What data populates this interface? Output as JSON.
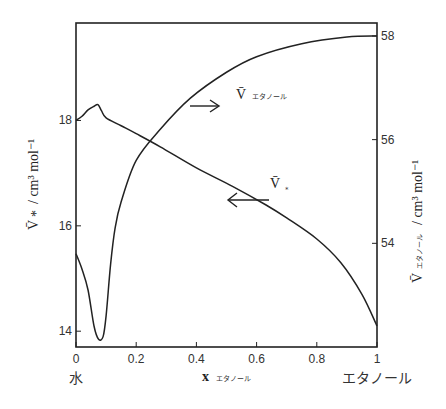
{
  "chart_data": {
    "type": "line",
    "title": "",
    "xlabel": "x エタノール",
    "x_axis": {
      "range": [
        0,
        1
      ],
      "ticks": [
        0,
        0.2,
        0.4,
        0.6,
        0.8,
        1
      ],
      "tick_labels": [
        "0",
        "0.2",
        "0.4",
        "0.6",
        "0.8",
        "1"
      ],
      "end_labels": {
        "left": "水",
        "right": "エタノール"
      },
      "label_main": "x",
      "label_sub": "エタノール"
    },
    "y_left": {
      "label_main": "V̄",
      "label_sub": "水",
      "label_unit": "/ cm³ mol⁻¹",
      "ylim": [
        13.7,
        19.85
      ],
      "ticks": [
        14,
        16,
        18
      ],
      "tick_labels": [
        "14",
        "16",
        "18"
      ]
    },
    "y_right": {
      "label_main": "V̄",
      "label_sub": "エタノール",
      "label_unit": "/ cm³ mol⁻¹",
      "ylim": [
        52.0,
        58.25
      ],
      "ticks": [
        54,
        56,
        58
      ],
      "tick_labels": [
        "54",
        "56",
        "58"
      ]
    },
    "grid": false,
    "legend": "inline annotations with arrows",
    "series": [
      {
        "name": "V̄ 水",
        "axis": "left",
        "annotation": {
          "main": "V̄",
          "sub": "水",
          "arrow": "left"
        },
        "x": [
          0,
          0.02,
          0.04,
          0.06,
          0.073,
          0.085,
          0.1,
          0.15,
          0.2,
          0.28,
          0.4,
          0.52,
          0.63,
          0.7,
          0.8,
          0.88,
          0.95,
          1.0
        ],
        "y": [
          18.0,
          18.08,
          18.2,
          18.27,
          18.3,
          18.18,
          18.05,
          17.9,
          17.75,
          17.5,
          17.1,
          16.75,
          16.4,
          16.15,
          15.75,
          15.3,
          14.7,
          14.1
        ]
      },
      {
        "name": "V̄ エタノール",
        "axis": "right",
        "annotation": {
          "main": "V̄",
          "sub": "エタノール",
          "arrow": "right"
        },
        "x": [
          0,
          0.02,
          0.04,
          0.06,
          0.075,
          0.09,
          0.1,
          0.115,
          0.13,
          0.15,
          0.2,
          0.28,
          0.38,
          0.5,
          0.6,
          0.75,
          0.9,
          1.0
        ],
        "y": [
          53.8,
          53.5,
          53.1,
          52.4,
          52.15,
          52.2,
          52.6,
          53.6,
          54.3,
          54.8,
          55.6,
          56.2,
          56.8,
          57.3,
          57.6,
          57.85,
          57.98,
          58.0
        ]
      }
    ]
  }
}
